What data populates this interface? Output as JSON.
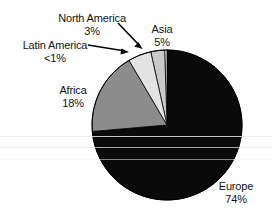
{
  "chart_data": {
    "type": "pie",
    "title": "",
    "subtitle": "",
    "xlabel": "",
    "ylabel": "",
    "legend_position": "none",
    "grid": false,
    "start_angle_deg": 0,
    "direction": "counterclockwise",
    "categories": [
      "Europe",
      "Africa",
      "Asia",
      "North America",
      "Latin America"
    ],
    "values": [
      74,
      18,
      5,
      3,
      0.5
    ],
    "value_labels": [
      "74%",
      "18%",
      "5%",
      "3%",
      "<1%"
    ],
    "colors": [
      "#0a0a0a",
      "#8c8c8c",
      "#e3e3e3",
      "#c9c9c9",
      "#fdfdfd"
    ],
    "slices": [
      {
        "name": "Europe",
        "value": 74,
        "label": "Europe",
        "value_label": "74%",
        "color": "#0a0a0a",
        "label_placement": "outside-right"
      },
      {
        "name": "Africa",
        "value": 18,
        "label": "Africa",
        "value_label": "18%",
        "color": "#8c8c8c",
        "label_placement": "outside-left"
      },
      {
        "name": "Asia",
        "value": 5,
        "label": "Asia",
        "value_label": "5%",
        "color": "#e3e3e3",
        "label_placement": "outside-top"
      },
      {
        "name": "North America",
        "value": 3,
        "label": "North America",
        "value_label": "3%",
        "color": "#c9c9c9",
        "label_placement": "leader-arrow"
      },
      {
        "name": "Latin America",
        "value": 0.5,
        "label": "Latin America",
        "value_label": "<1%",
        "color": "#fdfdfd",
        "label_placement": "leader-arrow"
      }
    ]
  },
  "labels": {
    "north_america": {
      "name": "North America",
      "value": "3%"
    },
    "latin_america": {
      "name": "Latin America",
      "value": "<1%"
    },
    "asia": {
      "name": "Asia",
      "value": "5%"
    },
    "africa": {
      "name": "Africa",
      "value": "18%"
    },
    "europe": {
      "name": "Europe",
      "value": "74%"
    }
  },
  "style": {
    "background": "#ffffff",
    "text_color": "#111111",
    "outline_color": "#000000"
  }
}
